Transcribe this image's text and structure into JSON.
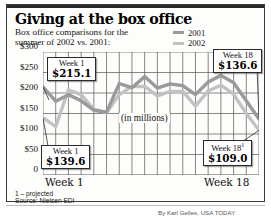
{
  "header": {
    "title": "Giving at the box office",
    "subtitle_line1": "Box office comparisons for the",
    "subtitle_line2": "summer of 2002 vs. 2001:"
  },
  "legend": {
    "position": "top-right",
    "items": [
      {
        "label": "2001",
        "color": "#9a9a9a",
        "icon": "line-swatch"
      },
      {
        "label": "2002",
        "color": "#c2c2c2",
        "icon": "line-swatch"
      }
    ]
  },
  "annotations": {
    "units": "(in millions)",
    "top_left": {
      "week": "Week 1",
      "sup": "",
      "value": "$215.1"
    },
    "bottom_left": {
      "week": "Week 1",
      "sup": "",
      "value": "$139.6"
    },
    "top_right": {
      "week": "Week 18",
      "sup": "",
      "value": "$136.6"
    },
    "bottom_right": {
      "week": "Week 18",
      "sup": "1",
      "value": "$109.0"
    }
  },
  "axis": {
    "x_first_label": "Week 1",
    "x_last_label": "Week 18",
    "y_ticks": [
      "$300",
      "$250",
      "$200",
      "$150",
      "$100",
      "$50",
      "0"
    ]
  },
  "footnotes": {
    "projected": "1 – projected",
    "source": "Source: Nielsen EDI"
  },
  "credit": "By Karl Gelles, USA TODAY",
  "chart_data": {
    "type": "line",
    "title": "Giving at the box office",
    "subtitle": "Box office comparisons for the summer of 2002 vs. 2001:",
    "xlabel": "",
    "ylabel": "(in millions)",
    "ylim": [
      0,
      300
    ],
    "yticks": [
      0,
      50,
      100,
      150,
      200,
      250,
      300
    ],
    "grid": true,
    "legend_position": "top-right",
    "x": [
      "Week 1",
      "Week 2",
      "Week 3",
      "Week 4",
      "Week 5",
      "Week 6",
      "Week 7",
      "Week 8",
      "Week 9",
      "Week 10",
      "Week 11",
      "Week 12",
      "Week 13",
      "Week 14",
      "Week 15",
      "Week 16",
      "Week 17",
      "Week 18"
    ],
    "series": [
      {
        "name": "2001",
        "color": "#9a9a9a",
        "values": [
          215.1,
          180.0,
          196.0,
          181.0,
          158.0,
          153.0,
          223.0,
          213.0,
          240.0,
          212.0,
          222.0,
          218.0,
          196.0,
          227.0,
          243.0,
          225.0,
          181.0,
          136.6
        ]
      },
      {
        "name": "2002",
        "color": "#c2c2c2",
        "values": [
          139.6,
          118.0,
          208.0,
          196.0,
          160.0,
          152.0,
          196.0,
          216.0,
          216.0,
          193.0,
          204.0,
          204.0,
          168.0,
          205.0,
          219.0,
          197.0,
          150.0,
          109.0
        ]
      }
    ],
    "endpoint_labels": [
      {
        "series": "2001",
        "x": "Week 1",
        "label": "$215.1"
      },
      {
        "series": "2002",
        "x": "Week 1",
        "label": "$139.6"
      },
      {
        "series": "2001",
        "x": "Week 18",
        "label": "$136.6"
      },
      {
        "series": "2002",
        "x": "Week 18",
        "label": "$109.0"
      }
    ]
  }
}
